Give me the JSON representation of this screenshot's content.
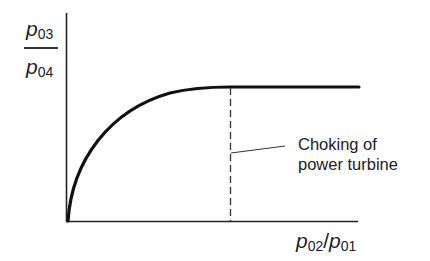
{
  "diagram": {
    "y_axis_label": {
      "numerator": {
        "symbol": "p",
        "subscript": "03"
      },
      "denominator": {
        "symbol": "p",
        "subscript": "04"
      }
    },
    "x_axis_label": {
      "numerator": {
        "symbol": "p",
        "subscript": "02"
      },
      "separator": "/",
      "denominator": {
        "symbol": "p",
        "subscript": "01"
      }
    },
    "annotation": {
      "line1": "Choking of",
      "line2": "power turbine"
    },
    "colors": {
      "line": "#111111",
      "background": "#ffffff"
    }
  }
}
